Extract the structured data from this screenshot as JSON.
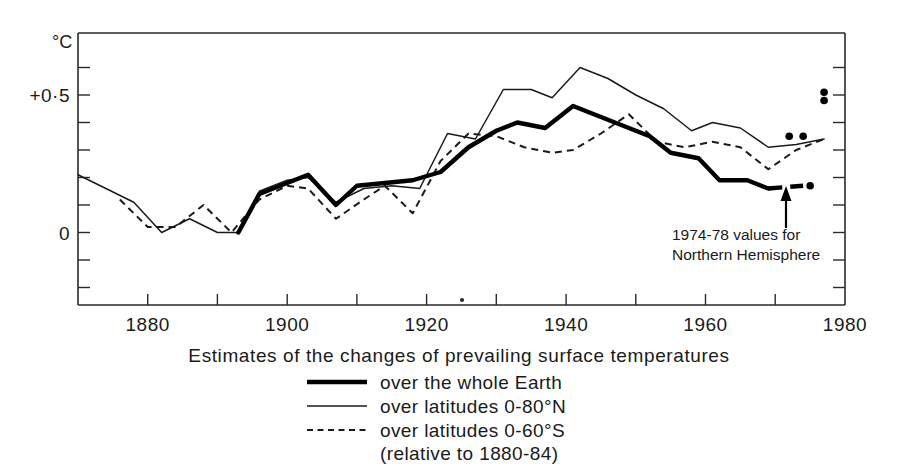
{
  "chart_data": {
    "type": "line",
    "title": "",
    "caption": "Estimates of the changes of prevailing surface temperatures",
    "xlabel": "",
    "ylabel": "°C",
    "yunit_label": "°C",
    "xlim": [
      1870,
      1980
    ],
    "ylim": [
      -0.3,
      0.7
    ],
    "xticks": [
      1870,
      1880,
      1890,
      1900,
      1910,
      1920,
      1930,
      1940,
      1950,
      1960,
      1970,
      1980
    ],
    "xticklabels": [
      "",
      "1880",
      "",
      "1900",
      "",
      "1920",
      "",
      "1940",
      "",
      "1960",
      "",
      "1980"
    ],
    "yticks": [
      -0.3,
      -0.2,
      -0.1,
      0.0,
      0.1,
      0.2,
      0.3,
      0.4,
      0.5,
      0.6,
      0.7
    ],
    "yticklabels": [
      "",
      "",
      "",
      "0",
      "",
      "",
      "",
      "",
      "+0·5",
      "",
      ""
    ],
    "grid": false,
    "legend_position": "below-center",
    "baseline_note": "(relative to 1880-84)",
    "series": [
      {
        "name": "over the whole Earth",
        "style": "thick-solid",
        "x": [
          1893,
          1896,
          1900,
          1903,
          1907,
          1910,
          1914,
          1918,
          1922,
          1926,
          1930,
          1933,
          1937,
          1941,
          1944,
          1948,
          1952,
          1955,
          1959,
          1962,
          1966,
          1969
        ],
        "values": [
          0.0,
          0.14,
          0.18,
          0.21,
          0.1,
          0.17,
          0.18,
          0.19,
          0.22,
          0.31,
          0.37,
          0.4,
          0.38,
          0.46,
          0.43,
          0.39,
          0.35,
          0.29,
          0.27,
          0.19,
          0.19,
          0.16
        ],
        "extension_style": "thick-dashed",
        "extension_x": [
          1969,
          1974
        ],
        "extension_values": [
          0.16,
          0.17
        ]
      },
      {
        "name": "over latitudes 0-80°N",
        "style": "thin-solid",
        "x": [
          1870,
          1874,
          1878,
          1882,
          1886,
          1890,
          1893,
          1896,
          1900,
          1903,
          1907,
          1911,
          1915,
          1919,
          1923,
          1927,
          1931,
          1935,
          1938,
          1942,
          1946,
          1950,
          1954,
          1958,
          1961,
          1965,
          1969,
          1973,
          1977
        ],
        "values": [
          0.21,
          0.16,
          0.11,
          0.0,
          0.05,
          0.0,
          0.0,
          0.15,
          0.19,
          0.2,
          0.11,
          0.16,
          0.17,
          0.16,
          0.36,
          0.34,
          0.52,
          0.52,
          0.49,
          0.6,
          0.56,
          0.5,
          0.45,
          0.37,
          0.4,
          0.38,
          0.31,
          0.32,
          0.34
        ]
      },
      {
        "name": "over latitudes 0-60°S",
        "style": "dashed",
        "x": [
          1876,
          1880,
          1884,
          1888,
          1892,
          1896,
          1900,
          1903,
          1907,
          1911,
          1914,
          1918,
          1922,
          1926,
          1930,
          1934,
          1938,
          1941,
          1945,
          1949,
          1953,
          1957,
          1961,
          1965,
          1969,
          1973,
          1977
        ],
        "values": [
          0.12,
          0.02,
          0.02,
          0.1,
          0.0,
          0.12,
          0.17,
          0.16,
          0.05,
          0.12,
          0.17,
          0.07,
          0.26,
          0.36,
          0.35,
          0.31,
          0.29,
          0.3,
          0.36,
          0.43,
          0.33,
          0.31,
          0.33,
          0.31,
          0.23,
          0.3,
          0.34
        ]
      }
    ],
    "scatter_points": {
      "name": "1974-78 values for Northern Hemisphere",
      "x": [
        1972,
        1974,
        1975,
        1977,
        1977
      ],
      "values": [
        0.35,
        0.35,
        0.17,
        0.51,
        0.48
      ]
    },
    "annotations": [
      {
        "text_line1": "1974-78 values for",
        "text_line2": "Northern Hemisphere",
        "arrow": "up-arrow"
      }
    ]
  },
  "axes": {
    "y_unit": "°C",
    "y_label_mid": "+0·5",
    "y_label_zero": "0",
    "x_labels": [
      "1880",
      "1900",
      "1920",
      "1940",
      "1960",
      "1980"
    ]
  },
  "caption": {
    "main": "Estimates of the changes of prevailing surface temperatures"
  },
  "legend": {
    "items": [
      {
        "label": "over the whole Earth",
        "style": "thick-solid"
      },
      {
        "label": "over latitudes 0-80°N",
        "style": "thin-solid"
      },
      {
        "label": "over latitudes 0-60°S",
        "style": "dashed"
      }
    ],
    "note": "(relative to 1880-84)"
  },
  "annotation": {
    "line1": "1974-78 values for",
    "line2": "Northern Hemisphere"
  },
  "colors": {
    "ink": "#1a1a1a",
    "line": "#000000",
    "background": "#ffffff"
  }
}
